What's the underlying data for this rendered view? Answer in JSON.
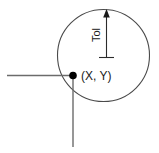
{
  "diagram": {
    "colors": {
      "stroke": "#4a4a4a",
      "dimension_stroke": "#1a1a1a",
      "point_fill": "#000000",
      "background": "#ffffff"
    },
    "labels": {
      "tolerance": "Tol",
      "point": "(X, Y)"
    },
    "circle": {
      "name": "tolerance-zone-circle",
      "cx": 103.5,
      "cy": 55.5,
      "r": 46.0
    },
    "point": {
      "name": "true-position-point",
      "cx": 73,
      "cy": 75.5,
      "r": 3.8
    },
    "horizontal_datum": {
      "name": "horizontal-datum-line",
      "x1": 7,
      "y1": 75.5,
      "x2": 73,
      "y2": 75.5
    },
    "vertical_datum": {
      "name": "vertical-datum-line",
      "x1": 73,
      "y1": 75.5,
      "x2": 73,
      "y2": 147
    },
    "dimension_line": {
      "name": "tolerance-dimension-line",
      "x": 106.5,
      "y_top": 10.5,
      "y_bottom": 58,
      "tick_half_width": 7.5,
      "arrow_width": 5,
      "arrow_height": 8
    },
    "tolerance_text": {
      "x": 100,
      "y": 35,
      "rotation": -90
    },
    "point_text": {
      "x": 82,
      "y": 80
    }
  }
}
